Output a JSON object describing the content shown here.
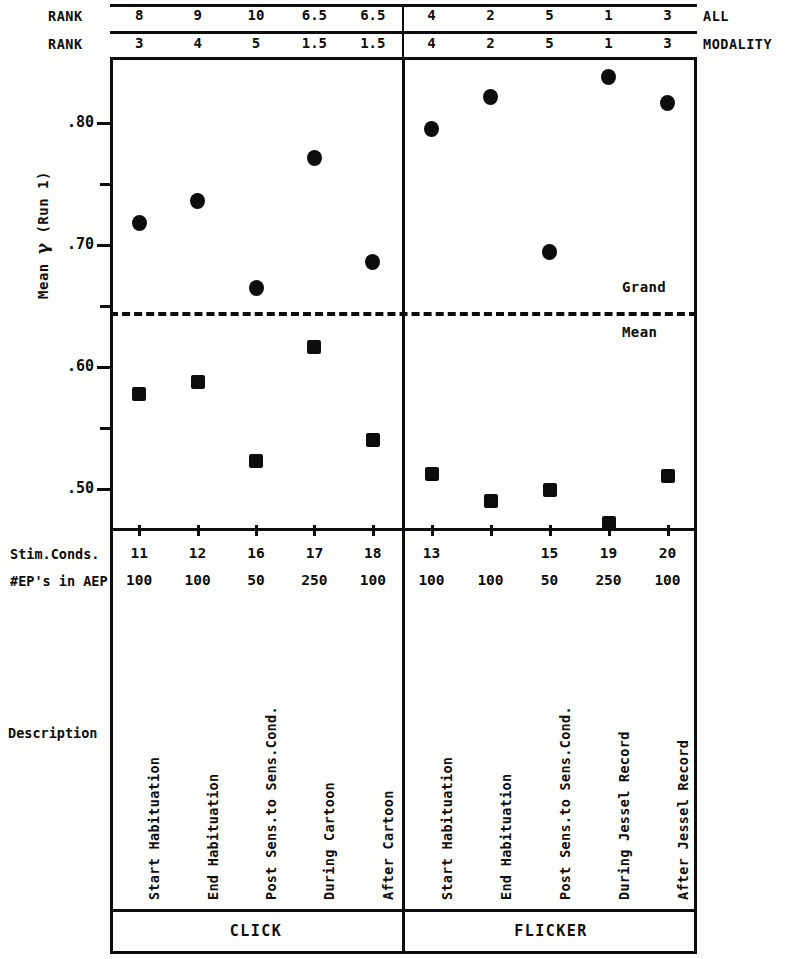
{
  "chart_data": {
    "type": "scatter",
    "title": "",
    "ylabel": "Mean γ (Run 1)",
    "xlabel": "",
    "ylim": [
      0.455,
      0.855
    ],
    "y_ticks_major": [
      0.8,
      0.7,
      0.6,
      0.5
    ],
    "y_ticks_major_labels": [
      ".80",
      ".70",
      ".60",
      ".50"
    ],
    "y_ticks_minor": [
      0.75,
      0.65,
      0.55
    ],
    "grid": false,
    "legend_position": "none",
    "grand_mean": 0.645,
    "grand_mean_label_top": "Grand",
    "grand_mean_label_bottom": "Mean",
    "panels": [
      {
        "name": "CLICK",
        "categories": [
          "11",
          "12",
          "16",
          "17",
          "18"
        ],
        "series": [
          {
            "name": "circle",
            "marker": "circle",
            "values": [
              0.718,
              0.736,
              0.665,
              0.771,
              0.686
            ]
          },
          {
            "name": "square",
            "marker": "square",
            "values": [
              0.578,
              0.588,
              0.523,
              0.616,
              0.54
            ]
          }
        ]
      },
      {
        "name": "FLICKER",
        "categories": [
          "13",
          "",
          "15",
          "19",
          "20"
        ],
        "series": [
          {
            "name": "circle",
            "marker": "circle",
            "values": [
              0.795,
              0.821,
              0.694,
              0.838,
              0.816
            ]
          },
          {
            "name": "square",
            "marker": "square",
            "values": [
              0.512,
              0.49,
              0.499,
              0.472,
              0.511
            ]
          }
        ]
      }
    ]
  },
  "rank_header": {
    "row_label_all": "RANK",
    "row_label_modality": "RANK",
    "right_label_all": "ALL",
    "right_label_modality": "MODALITY",
    "all": [
      "8",
      "9",
      "10",
      "6.5",
      "6.5",
      "4",
      "2",
      "5",
      "1",
      "3"
    ],
    "modality": [
      "3",
      "4",
      "5",
      "1.5",
      "1.5",
      "4",
      "2",
      "5",
      "1",
      "3"
    ]
  },
  "axis": {
    "y_title_prefix": "Mean ",
    "y_title_symbol": "γ",
    "y_title_suffix": " (Run 1)",
    "y_labels": [
      ".80",
      ".70",
      ".60",
      ".50"
    ]
  },
  "annotations": {
    "grand": "Grand",
    "mean": "Mean"
  },
  "table": {
    "row_labels": {
      "stim_conds": "Stim.Conds.",
      "eps_in_aep": "#EP's in AEP",
      "description": "Description"
    },
    "stim_conds": [
      "11",
      "12",
      "16",
      "17",
      "18",
      "13",
      "",
      "15",
      "19",
      "20"
    ],
    "eps_in_aep": [
      "100",
      "100",
      "50",
      "250",
      "100",
      "100",
      "100",
      "50",
      "250",
      "100"
    ],
    "descriptions": [
      "Start Habituation",
      "End Habituation",
      "Post Sens.to Sens.Cond.",
      "During Cartoon",
      "After Cartoon",
      "Start Habituation",
      "End Habituation",
      "Post Sens.to Sens.Cond.",
      "During Jessel Record",
      "After Jessel Record"
    ],
    "modalities": [
      "CLICK",
      "FLICKER"
    ]
  },
  "colors": {
    "ink": "#0d0d0d",
    "paper": "#fdfdfb",
    "plot_background": "#ffffff"
  }
}
